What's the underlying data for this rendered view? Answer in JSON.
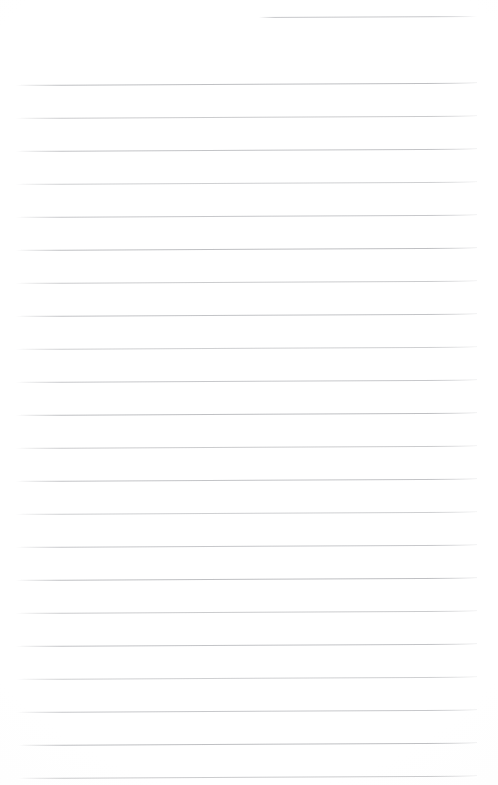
{
  "document": {
    "kind": "lined-notebook-page",
    "title": "Blank lined notebook page",
    "background_color": "#ffffff",
    "rule_color": "#8c8e94",
    "page_width": 498,
    "page_height": 785,
    "text_content": "",
    "visible_text": "",
    "handwriting_present": "none",
    "ruling": {
      "line_count": 23,
      "line_spacing_px": 33,
      "left_margin_px": 17,
      "right_margin_px": 477,
      "tilt_degrees": -0.28,
      "notes": "first rule is a short partial rule in the upper right; all other rules span the full width"
    },
    "rules": [
      {
        "index": 1,
        "y": 17,
        "x_start": 259,
        "x_end": 477,
        "partial": true
      },
      {
        "index": 2,
        "y": 85,
        "x_start": 16,
        "x_end": 477,
        "partial": false
      },
      {
        "index": 3,
        "y": 118,
        "x_start": 16,
        "x_end": 477,
        "partial": false
      },
      {
        "index": 4,
        "y": 151,
        "x_start": 16,
        "x_end": 477,
        "partial": false
      },
      {
        "index": 5,
        "y": 184,
        "x_start": 16,
        "x_end": 477,
        "partial": false
      },
      {
        "index": 6,
        "y": 217,
        "x_start": 16,
        "x_end": 477,
        "partial": false
      },
      {
        "index": 7,
        "y": 250,
        "x_start": 16,
        "x_end": 477,
        "partial": false
      },
      {
        "index": 8,
        "y": 283,
        "x_start": 16,
        "x_end": 477,
        "partial": false
      },
      {
        "index": 9,
        "y": 316,
        "x_start": 16,
        "x_end": 477,
        "partial": false
      },
      {
        "index": 10,
        "y": 349,
        "x_start": 16,
        "x_end": 477,
        "partial": false
      },
      {
        "index": 11,
        "y": 382,
        "x_start": 16,
        "x_end": 477,
        "partial": false
      },
      {
        "index": 12,
        "y": 415,
        "x_start": 16,
        "x_end": 477,
        "partial": false
      },
      {
        "index": 13,
        "y": 448,
        "x_start": 16,
        "x_end": 477,
        "partial": false
      },
      {
        "index": 14,
        "y": 481,
        "x_start": 16,
        "x_end": 477,
        "partial": false
      },
      {
        "index": 15,
        "y": 514,
        "x_start": 16,
        "x_end": 477,
        "partial": false
      },
      {
        "index": 16,
        "y": 547,
        "x_start": 16,
        "x_end": 477,
        "partial": false
      },
      {
        "index": 17,
        "y": 580,
        "x_start": 16,
        "x_end": 477,
        "partial": false
      },
      {
        "index": 18,
        "y": 613,
        "x_start": 16,
        "x_end": 477,
        "partial": false
      },
      {
        "index": 19,
        "y": 646,
        "x_start": 16,
        "x_end": 477,
        "partial": false
      },
      {
        "index": 20,
        "y": 679,
        "x_start": 17,
        "x_end": 477,
        "partial": false
      },
      {
        "index": 21,
        "y": 712,
        "x_start": 17,
        "x_end": 477,
        "partial": false
      },
      {
        "index": 22,
        "y": 745,
        "x_start": 18,
        "x_end": 477,
        "partial": false
      },
      {
        "index": 23,
        "y": 778,
        "x_start": 18,
        "x_end": 477,
        "partial": false
      }
    ]
  }
}
